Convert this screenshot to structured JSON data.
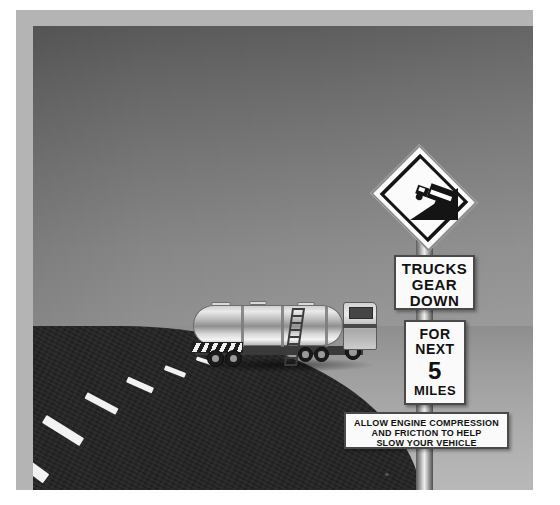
{
  "scene": {
    "title": "Highway downgrade warning signs with tanker truck",
    "background_colors": {
      "sky_top": "#5d5d5d",
      "sky_bottom": "#9e9e9e",
      "ground": "#a8a8a8",
      "asphalt": "#242424",
      "photo_border": "#b4b4b4",
      "page": "#ffffff",
      "sign_face": "#fafafa",
      "sign_text": "#111111",
      "lane_marking": "#f2f2f2"
    }
  },
  "signs": {
    "warning_diamond": {
      "name": "steep-downgrade-truck-symbol",
      "shape": "diamond",
      "symbol": "truck-descending-grade"
    },
    "gear_down": {
      "lines": [
        "TRUCKS",
        "GEAR",
        "DOWN"
      ]
    },
    "distance": {
      "line1": "FOR",
      "line2": "NEXT",
      "number": "5",
      "unit": "MILES"
    },
    "advisory": {
      "lines": [
        "ALLOW ENGINE COMPRESSION",
        "AND FRICTION TO HELP",
        "SLOW YOUR VEHICLE"
      ]
    }
  },
  "vehicle": {
    "type": "tanker-truck",
    "description": "articulated fuel tanker semi-trailer on curving roadway"
  },
  "road": {
    "lane_marking_style": "dashed-center-line",
    "dash_count": 6,
    "curve": "left-hand sweeping curve"
  }
}
